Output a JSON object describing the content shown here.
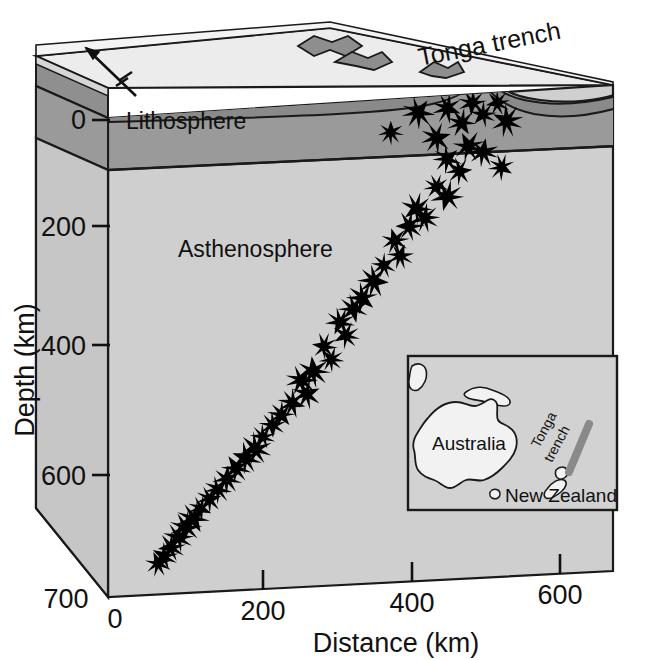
{
  "figure": {
    "title_visible": false,
    "kind": "block-diagram-cross-section"
  },
  "axes": {
    "x": {
      "label": "Distance (km)",
      "ticks": [
        0,
        200,
        400,
        600
      ],
      "tick_labels": [
        "0",
        "200",
        "400",
        "600"
      ],
      "range": [
        0,
        700
      ],
      "units": "km"
    },
    "y": {
      "label": "Depth (km)",
      "ticks": [
        0,
        200,
        400,
        600,
        700
      ],
      "tick_labels": [
        "0",
        "200",
        "400",
        "600",
        "700"
      ],
      "range": [
        0,
        700
      ],
      "units": "km",
      "direction": "down"
    }
  },
  "annotations": {
    "lithosphere": "Lithosphere",
    "asthenosphere": "Asthenosphere",
    "tonga_trench": "Tonga trench",
    "plate_motion_arrow": "plate-motion-arrow"
  },
  "inset": {
    "australia": "Australia",
    "new_zealand": "New Zealand",
    "tonga_trench_line1": "Tonga",
    "tonga_trench_line2": "trench"
  },
  "colors": {
    "surface_top": "#e8e8e8",
    "lithosphere_fill": "#9a9a9a",
    "lithosphere_side": "#8c8c8c",
    "asthenosphere_fill": "#cfcfcf",
    "slab_fill": "#8a8a8a",
    "mountain_fill": "#8e8e8e",
    "stroke": "#1a1a1a",
    "star_fill": "#000000",
    "trench_bar": "#8a8a8a",
    "inset_bg": "#cfcfcf"
  },
  "chart_data": {
    "type": "scatter",
    "xlabel": "Distance (km)",
    "ylabel": "Depth (km)",
    "xlim": [
      0,
      700
    ],
    "ylim": [
      0,
      700
    ],
    "grid": false,
    "legend": null,
    "marker": "star",
    "series": [
      {
        "name": "Earthquake foci",
        "points": [
          [
            392,
            48
          ],
          [
            430,
            22
          ],
          [
            455,
            60
          ],
          [
            470,
            18
          ],
          [
            490,
            40
          ],
          [
            505,
            12
          ],
          [
            520,
            30
          ],
          [
            540,
            15
          ],
          [
            553,
            42
          ],
          [
            500,
            75
          ],
          [
            520,
            85
          ],
          [
            470,
            92
          ],
          [
            487,
            110
          ],
          [
            545,
            108
          ],
          [
            455,
            130
          ],
          [
            470,
            145
          ],
          [
            428,
            160
          ],
          [
            418,
            185
          ],
          [
            440,
            175
          ],
          [
            398,
            205
          ],
          [
            405,
            228
          ],
          [
            382,
            240
          ],
          [
            368,
            262
          ],
          [
            352,
            285
          ],
          [
            340,
            300
          ],
          [
            322,
            318
          ],
          [
            330,
            338
          ],
          [
            300,
            352
          ],
          [
            310,
            372
          ],
          [
            285,
            388
          ],
          [
            268,
            400
          ],
          [
            275,
            420
          ],
          [
            255,
            432
          ],
          [
            240,
            448
          ],
          [
            228,
            462
          ],
          [
            215,
            478
          ],
          [
            205,
            495
          ],
          [
            192,
            508
          ],
          [
            178,
            522
          ],
          [
            165,
            538
          ],
          [
            152,
            552
          ],
          [
            140,
            565
          ],
          [
            128,
            578
          ],
          [
            118,
            592
          ],
          [
            108,
            604
          ],
          [
            98,
            618
          ],
          [
            88,
            632
          ],
          [
            78,
            645
          ],
          [
            70,
            655
          ]
        ]
      }
    ]
  }
}
